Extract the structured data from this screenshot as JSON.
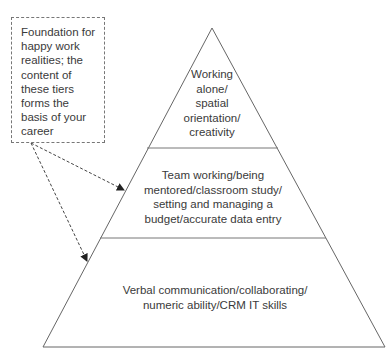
{
  "callout": {
    "text": "Foundation for happy work realities; the content of these tiers forms the basis of your career",
    "lines": [
      "Foundation for",
      "happy work",
      "realities; the",
      "content of",
      "these tiers",
      "forms the",
      "basis of your",
      "career"
    ]
  },
  "pyramid": {
    "tiers": [
      {
        "level": "top",
        "lines": [
          "Working",
          "alone/",
          "spatial",
          "orientation/",
          "creativity"
        ]
      },
      {
        "level": "middle",
        "lines": [
          "Team working/being",
          "mentored/classroom study/",
          "setting and managing a",
          "budget/accurate data entry"
        ]
      },
      {
        "level": "bottom",
        "lines": [
          "Verbal communication/collaborating/",
          "numeric ability/CRM IT skills"
        ]
      }
    ]
  },
  "colors": {
    "line": "#666666",
    "text": "#3a3a3a",
    "background": "#ffffff"
  }
}
